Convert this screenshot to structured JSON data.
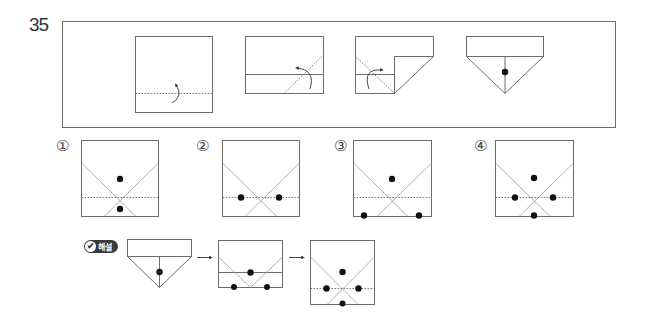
{
  "question": {
    "number": "35"
  },
  "problem_steps": [
    {
      "step": 1,
      "description": "square with horizontal dotted fold line near bottom, fold-up arrow"
    },
    {
      "step": 2,
      "description": "bottom folded up; diagonal dotted fold line on right, fold arrow"
    },
    {
      "step": 3,
      "description": "right corner folded; diagonal dotted fold line on left, fold arrow"
    },
    {
      "step": 4,
      "description": "folded shape (rectangle with triangle below) with a punched hole"
    }
  ],
  "options": [
    {
      "label": "①",
      "holes": 2
    },
    {
      "label": "②",
      "holes": 2
    },
    {
      "label": "③",
      "holes": 3
    },
    {
      "label": "④",
      "holes": 4
    }
  ],
  "explanation": {
    "badge_check": "✔",
    "badge_text": "해설",
    "arrow_1": "→",
    "arrow_2": "→",
    "answer": "④"
  },
  "colors": {
    "line": "#6d6d6d",
    "dot": "#111111",
    "badge_bg": "#3a3a3a"
  }
}
